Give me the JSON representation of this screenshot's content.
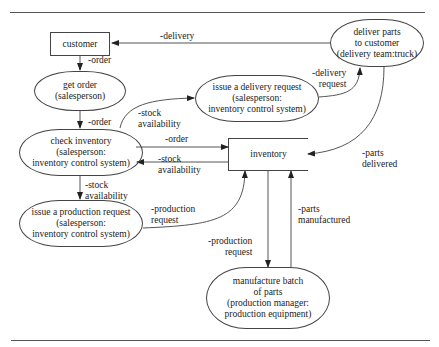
{
  "diagram": {
    "type": "process flow diagram",
    "nodes": {
      "customer": {
        "label": "customer",
        "shape": "rectangle"
      },
      "get_order": {
        "label": "get order\n(salesperson)",
        "shape": "rounded"
      },
      "check_inventory": {
        "label": "check inventory\n(salesperson:\ninventory control system)",
        "shape": "rounded"
      },
      "issue_production": {
        "label": "issue a production request\n(salesperson:\ninventory control system)",
        "shape": "rounded"
      },
      "issue_delivery": {
        "label": "issue a delivery request\n(salesperson:\ninventory control system)",
        "shape": "rounded"
      },
      "deliver_parts": {
        "label": "deliver parts\nto customer\n(delivery team:truck)",
        "shape": "rounded"
      },
      "inventory": {
        "label": "inventory",
        "shape": "data store"
      },
      "manufacture": {
        "label": "manufacture batch\nof parts\n(production  manager:\nproduction equipment)",
        "shape": "rounded"
      }
    },
    "edges": {
      "delivery": {
        "label": "-delivery",
        "from": "deliver parts to customer",
        "to": "customer"
      },
      "order_1": {
        "label": "-order",
        "from": "customer",
        "to": "get order"
      },
      "order_2": {
        "label": "-order",
        "from": "get order",
        "to": "check inventory"
      },
      "stock_avail_up": {
        "label": "-stock\navailability",
        "from": "check inventory",
        "to": "issue a delivery request"
      },
      "delivery_request": {
        "label": "-delivery\nrequest",
        "from": "issue a delivery request",
        "to": "deliver parts to customer"
      },
      "order_3": {
        "label": "-order",
        "from": "check inventory",
        "to": "inventory"
      },
      "stock_avail_back": {
        "label": "-stock\navailability",
        "from": "inventory",
        "to": "check inventory"
      },
      "stock_avail_down": {
        "label": "-stock\navailability",
        "from": "check inventory",
        "to": "issue a production request"
      },
      "production_request_1": {
        "label": "-production\nrequest",
        "from": "issue a production request",
        "to": "inventory"
      },
      "parts_delivered": {
        "label": "-parts\ndelivered",
        "from": "deliver parts to customer",
        "to": "inventory"
      },
      "production_request_2": {
        "label": "-production\nrequest",
        "from": "inventory",
        "to": "manufacture batch of parts"
      },
      "parts_manufactured": {
        "label": "-parts\nmanufactured",
        "from": "manufacture batch of parts",
        "to": "inventory"
      }
    }
  }
}
